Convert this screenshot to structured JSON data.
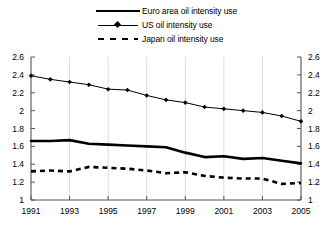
{
  "legend": {
    "position": "top-center",
    "items": [
      {
        "label": "Euro area oil intensity use",
        "style": "solid-thick",
        "name": "euro-area"
      },
      {
        "label": "US oil intensity use",
        "style": "line-with-diamond-marker",
        "name": "us"
      },
      {
        "label": "Japan oil intensity use",
        "style": "dashed-thick",
        "name": "japan"
      }
    ]
  },
  "chart_data": {
    "type": "line",
    "title": "",
    "subtitle": "",
    "xlabel": "",
    "ylabel": "",
    "x": [
      1991,
      1992,
      1993,
      1994,
      1995,
      1996,
      1997,
      1998,
      1999,
      2000,
      2001,
      2002,
      2003,
      2004,
      2005
    ],
    "xlim": [
      1991,
      2005
    ],
    "ylim": [
      1,
      2.6
    ],
    "xticks": [
      1991,
      1993,
      1995,
      1997,
      1999,
      2001,
      2003,
      2005
    ],
    "xtick_labels": [
      "1991",
      "1993",
      "1995",
      "1997",
      "1999",
      "2001",
      "2003",
      "2005"
    ],
    "yticks": [
      1,
      1.2,
      1.4,
      1.6,
      1.8,
      2,
      2.2,
      2.4,
      2.6
    ],
    "ytick_labels": [
      "1",
      "1.2",
      "1.4",
      "1.6",
      "1.8",
      "2",
      "2.2",
      "2.4",
      "2.6"
    ],
    "y_axis_both_sides": true,
    "grid": {
      "vertical": true,
      "horizontal": false,
      "color": "#dcdcdc"
    },
    "legend_position": "top-center",
    "series": [
      {
        "name": "Euro area oil intensity use",
        "values": [
          1.66,
          1.66,
          1.67,
          1.63,
          1.62,
          1.61,
          1.6,
          1.59,
          1.53,
          1.48,
          1.49,
          1.46,
          1.47,
          1.44,
          1.41
        ],
        "markers": false,
        "dashed": false
      },
      {
        "name": "US oil intensity use",
        "values": [
          2.39,
          2.35,
          2.32,
          2.29,
          2.24,
          2.23,
          2.17,
          2.12,
          2.09,
          2.04,
          2.02,
          2.0,
          1.98,
          1.94,
          1.88
        ],
        "markers": true,
        "dashed": false
      },
      {
        "name": "Japan oil intensity use",
        "values": [
          1.32,
          1.33,
          1.32,
          1.37,
          1.36,
          1.35,
          1.33,
          1.3,
          1.31,
          1.27,
          1.25,
          1.24,
          1.24,
          1.18,
          1.19
        ],
        "markers": false,
        "dashed": true
      }
    ]
  },
  "axes": {
    "left_labels": [
      "2.6",
      "2.4",
      "2.2",
      "2",
      "1.8",
      "1.6",
      "1.4",
      "1.2",
      "1"
    ],
    "right_labels": [
      "2.6",
      "2.4",
      "2.2",
      "2",
      "1.8",
      "1.6",
      "1.4",
      "1.2",
      "1"
    ]
  }
}
